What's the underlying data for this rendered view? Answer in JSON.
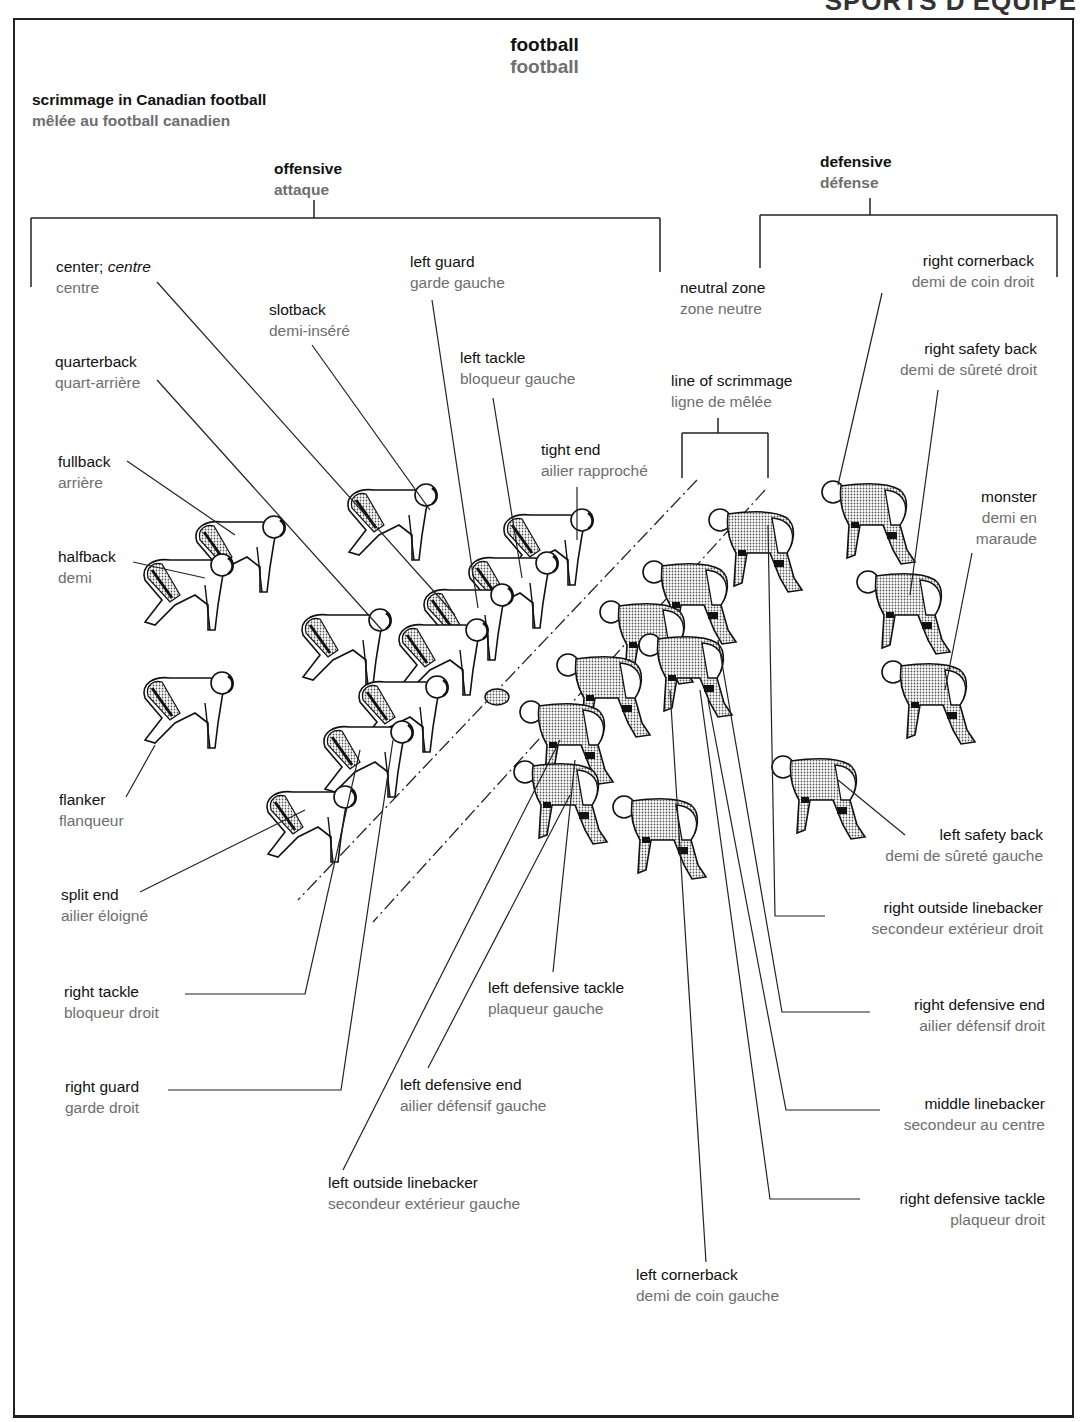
{
  "page_header_partial": "SPORTS D'ÉQUIPE",
  "title": {
    "en": "football",
    "fr": "football"
  },
  "subtitle": {
    "en": "scrimmage in Canadian football",
    "fr": "mêlée au football canadien"
  },
  "groups": {
    "offensive": {
      "en": "offensive",
      "fr": "attaque"
    },
    "defensive": {
      "en": "defensive",
      "fr": "défense"
    }
  },
  "zones": {
    "neutral_zone": {
      "en": "neutral zone",
      "fr": "zone neutre"
    },
    "line_of_scrimmage": {
      "en": "line of scrimmage",
      "fr": "ligne de mêlée"
    }
  },
  "offense": {
    "center": {
      "en": "center;",
      "en_alt": "centre",
      "fr": "centre"
    },
    "left_guard": {
      "en": "left guard",
      "fr": "garde gauche"
    },
    "slotback": {
      "en": "slotback",
      "fr": "demi-inséré"
    },
    "quarterback": {
      "en": "quarterback",
      "fr": "quart-arrière"
    },
    "left_tackle": {
      "en": "left tackle",
      "fr": "bloqueur gauche"
    },
    "tight_end": {
      "en": "tight end",
      "fr": "ailier rapproché"
    },
    "fullback": {
      "en": "fullback",
      "fr": "arrière"
    },
    "halfback": {
      "en": "halfback",
      "fr": "demi"
    },
    "flanker": {
      "en": "flanker",
      "fr": "flanqueur"
    },
    "split_end": {
      "en": "split end",
      "fr": "ailier éloigné"
    },
    "right_tackle": {
      "en": "right tackle",
      "fr": "bloqueur droit"
    },
    "right_guard": {
      "en": "right guard",
      "fr": "garde droit"
    }
  },
  "defense": {
    "right_cornerback": {
      "en": "right cornerback",
      "fr": "demi de coin droit"
    },
    "right_safety_back": {
      "en": "right safety back",
      "fr": "demi de sûreté droit"
    },
    "monster": {
      "en": "monster",
      "fr_line1": "demi en",
      "fr_line2": "maraude"
    },
    "left_safety_back": {
      "en": "left safety back",
      "fr": "demi de sûreté gauche"
    },
    "right_outside_linebacker": {
      "en": "right outside linebacker",
      "fr": "secondeur extérieur droit"
    },
    "right_defensive_end": {
      "en": "right defensive end",
      "fr": "ailier défensif droit"
    },
    "middle_linebacker": {
      "en": "middle linebacker",
      "fr": "secondeur au centre"
    },
    "right_defensive_tackle": {
      "en": "right defensive tackle",
      "fr": "plaqueur droit"
    },
    "left_cornerback": {
      "en": "left cornerback",
      "fr": "demi de coin gauche"
    },
    "left_defensive_tackle": {
      "en": "left defensive tackle",
      "fr": "plaqueur gauche"
    },
    "left_defensive_end": {
      "en": "left defensive end",
      "fr": "ailier défensif gauche"
    },
    "left_outside_linebacker": {
      "en": "left outside linebacker",
      "fr": "secondeur extérieur gauche"
    }
  },
  "colors": {
    "english_text": "#111111",
    "french_text": "#6e6e6e",
    "lines": "#222222",
    "defense_jersey": "#b8b8b8",
    "offense_jersey": "#ffffff"
  }
}
